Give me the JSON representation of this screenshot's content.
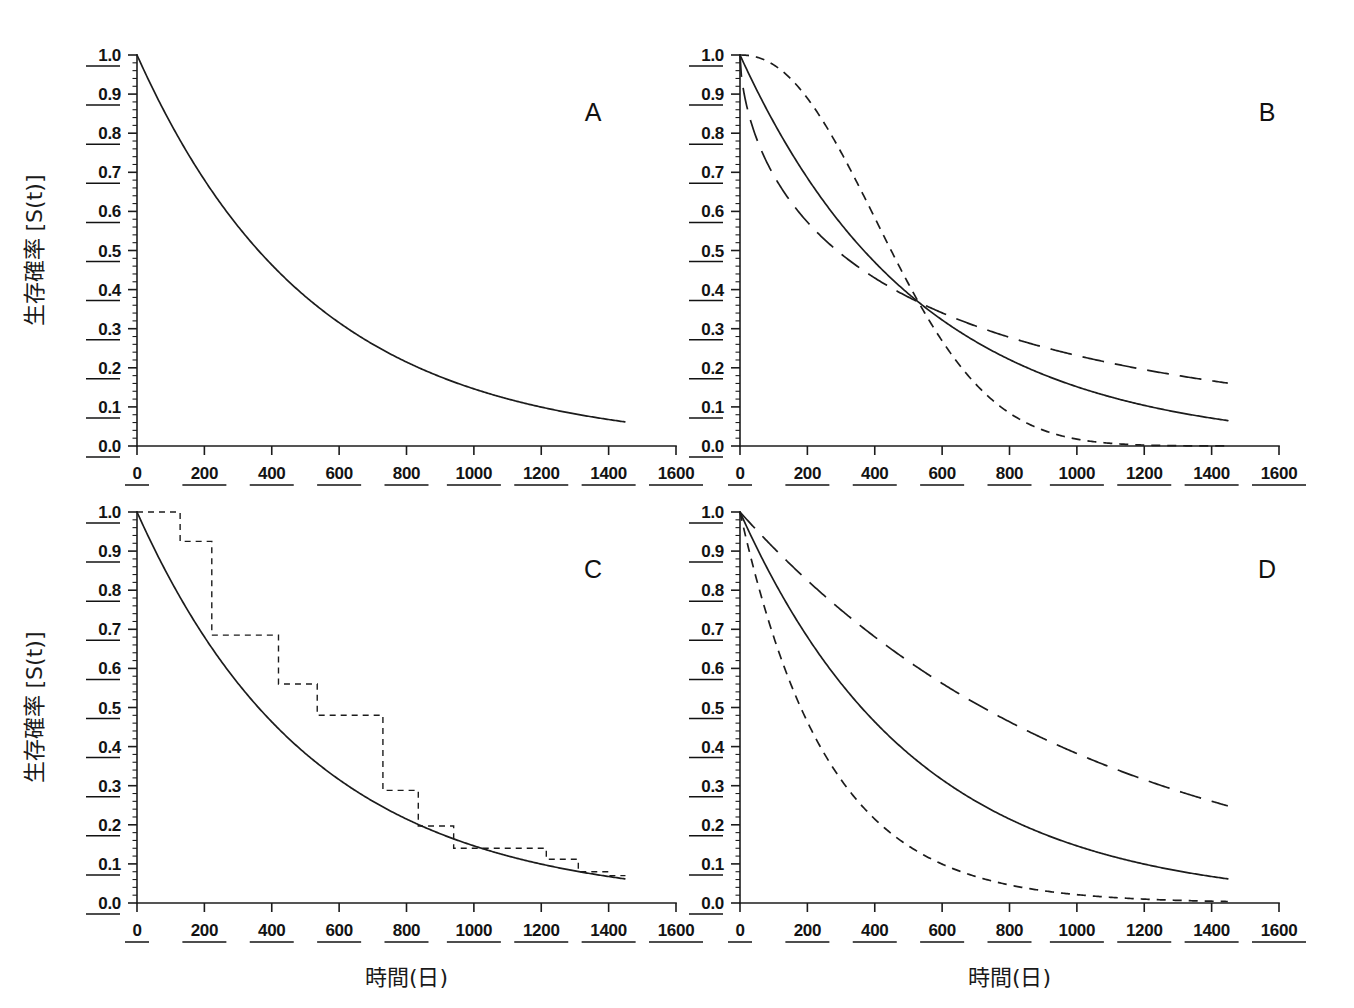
{
  "figure": {
    "background": "#ffffff",
    "ink_color": "#1c1c1c",
    "width": 1354,
    "height": 1008
  },
  "axis_titles": {
    "y": "生存確率 [S(t)]",
    "x": "時間(日)"
  },
  "tick_labels": {
    "y": [
      "0.0",
      "0.1",
      "0.2",
      "0.3",
      "0.4",
      "0.5",
      "0.6",
      "0.7",
      "0.8",
      "0.9",
      "1.0"
    ],
    "x": [
      "0",
      "200",
      "400",
      "600",
      "800",
      "1000",
      "1200",
      "1400",
      "1600"
    ]
  },
  "panel_letters": [
    "A",
    "B",
    "C",
    "D"
  ],
  "chart_data": [
    {
      "id": "A",
      "type": "line",
      "title": "A",
      "xlabel": "時間(日)",
      "ylabel": "生存確率 [S(t)]",
      "xlim": [
        0,
        1600
      ],
      "ylim": [
        0.0,
        1.0
      ],
      "xticks": [
        0,
        200,
        400,
        600,
        800,
        1000,
        1200,
        1400,
        1600
      ],
      "yticks": [
        0.0,
        0.1,
        0.2,
        0.3,
        0.4,
        0.5,
        0.6,
        0.7,
        0.8,
        0.9,
        1.0
      ],
      "grid": false,
      "legend": "none",
      "description": "Single exponential survival curve S(t)=exp(-t/520), drawn from t=0 to t=1450.",
      "series": [
        {
          "name": "exponential",
          "style": "solid",
          "model": "exp(-t/520)",
          "x": [
            0,
            50,
            100,
            150,
            200,
            250,
            300,
            350,
            400,
            450,
            500,
            550,
            600,
            650,
            700,
            750,
            800,
            850,
            900,
            950,
            1000,
            1050,
            1100,
            1150,
            1200,
            1250,
            1300,
            1350,
            1400,
            1450
          ],
          "y": [
            1.0,
            0.908,
            0.825,
            0.749,
            0.681,
            0.618,
            0.562,
            0.51,
            0.463,
            0.421,
            0.382,
            0.347,
            0.315,
            0.287,
            0.26,
            0.237,
            0.215,
            0.195,
            0.177,
            0.161,
            0.146,
            0.133,
            0.121,
            0.11,
            0.1,
            0.091,
            0.082,
            0.075,
            0.068,
            0.062
          ]
        }
      ]
    },
    {
      "id": "B",
      "type": "line",
      "title": "B",
      "xlabel": "時間(日)",
      "ylabel": "生存確率 [S(t)]",
      "xlim": [
        0,
        1600
      ],
      "ylim": [
        0.0,
        1.0
      ],
      "xticks": [
        0,
        200,
        400,
        600,
        800,
        1000,
        1200,
        1400,
        1600
      ],
      "yticks": [
        0.0,
        0.1,
        0.2,
        0.3,
        0.4,
        0.5,
        0.6,
        0.7,
        0.8,
        0.9,
        1.0
      ],
      "grid": false,
      "legend": "none",
      "description": "Three Weibull survival curves with common scale 530 days, crossing at S=0.368 at t=530. Shape parameters 0.6 (long dash), 1.0 (solid), 2.2 (short dash).",
      "crossing_point": {
        "x": 530,
        "y": 0.368
      },
      "series": [
        {
          "name": "weibull-shape-2.2",
          "style": "short-dash",
          "model": "exp(-(t/530)^2.2)",
          "x": [
            0,
            50,
            100,
            150,
            200,
            250,
            300,
            350,
            400,
            450,
            500,
            530,
            550,
            600,
            650,
            700,
            750,
            800,
            850,
            900,
            950,
            1000,
            1050,
            1100,
            1150,
            1200,
            1250,
            1300,
            1350,
            1400,
            1450
          ],
          "y": [
            1.0,
            0.994,
            0.975,
            0.946,
            0.906,
            0.857,
            0.8,
            0.736,
            0.668,
            0.597,
            0.524,
            0.48,
            0.452,
            0.382,
            0.316,
            0.255,
            0.2,
            0.153,
            0.113,
            0.081,
            0.056,
            0.038,
            0.024,
            0.015,
            0.009,
            0.005,
            0.003,
            0.0015,
            0.0008,
            0.0004,
            0.0002
          ]
        },
        {
          "name": "weibull-shape-1.0",
          "style": "solid",
          "model": "exp(-(t/530)^1.0)",
          "x": [
            0,
            50,
            100,
            150,
            200,
            250,
            300,
            350,
            400,
            450,
            500,
            530,
            550,
            600,
            650,
            700,
            750,
            800,
            850,
            900,
            950,
            1000,
            1050,
            1100,
            1150,
            1200,
            1250,
            1300,
            1350,
            1400,
            1450
          ],
          "y": [
            1.0,
            0.91,
            0.828,
            0.754,
            0.686,
            0.624,
            0.568,
            0.517,
            0.471,
            0.428,
            0.39,
            0.368,
            0.355,
            0.323,
            0.294,
            0.268,
            0.243,
            0.222,
            0.202,
            0.183,
            0.167,
            0.152,
            0.138,
            0.126,
            0.114,
            0.104,
            0.095,
            0.086,
            0.078,
            0.071,
            0.065
          ]
        },
        {
          "name": "weibull-shape-0.6",
          "style": "long-dash",
          "model": "exp(-(t/530)^0.6)",
          "x": [
            0,
            50,
            100,
            150,
            200,
            250,
            300,
            350,
            400,
            450,
            500,
            530,
            550,
            600,
            650,
            700,
            750,
            800,
            850,
            900,
            950,
            1000,
            1050,
            1100,
            1150,
            1200,
            1250,
            1300,
            1350,
            1400,
            1450
          ],
          "y": [
            1.0,
            0.762,
            0.68,
            0.623,
            0.578,
            0.541,
            0.509,
            0.481,
            0.456,
            0.434,
            0.414,
            0.402,
            0.395,
            0.378,
            0.362,
            0.348,
            0.334,
            0.321,
            0.309,
            0.298,
            0.287,
            0.277,
            0.268,
            0.259,
            0.251,
            0.243,
            0.235,
            0.228,
            0.221,
            0.215,
            0.208
          ]
        }
      ]
    },
    {
      "id": "C",
      "type": "line",
      "title": "C",
      "xlabel": "時間(日)",
      "ylabel": "生存確率 [S(t)]",
      "xlim": [
        0,
        1600
      ],
      "ylim": [
        0.0,
        1.0
      ],
      "xticks": [
        0,
        200,
        400,
        600,
        800,
        1000,
        1200,
        1400,
        1600
      ],
      "yticks": [
        0.0,
        0.1,
        0.2,
        0.3,
        0.4,
        0.5,
        0.6,
        0.7,
        0.8,
        0.9,
        1.0
      ],
      "grid": false,
      "legend": "none",
      "description": "Kaplan-Meier step estimate (dashed) overlaid on the fitted exponential survival curve exp(-t/520) (solid).",
      "series": [
        {
          "name": "fitted-exponential",
          "style": "solid",
          "model": "exp(-t/520)",
          "x": [
            0,
            50,
            100,
            150,
            200,
            250,
            300,
            350,
            400,
            450,
            500,
            550,
            600,
            650,
            700,
            750,
            800,
            850,
            900,
            950,
            1000,
            1050,
            1100,
            1150,
            1200,
            1250,
            1300,
            1350,
            1400,
            1450
          ],
          "y": [
            1.0,
            0.908,
            0.825,
            0.749,
            0.681,
            0.618,
            0.562,
            0.51,
            0.463,
            0.421,
            0.382,
            0.347,
            0.315,
            0.287,
            0.26,
            0.237,
            0.215,
            0.195,
            0.177,
            0.161,
            0.146,
            0.133,
            0.121,
            0.11,
            0.1,
            0.091,
            0.082,
            0.075,
            0.068,
            0.062
          ]
        },
        {
          "name": "kaplan-meier-step",
          "style": "km-dashed-step",
          "step_times": [
            0,
            70,
            128,
            222,
            237,
            420,
            535,
            548,
            730,
            820,
            835,
            925,
            940,
            1055,
            1215,
            1300,
            1310,
            1380,
            1450
          ],
          "step_values": [
            1.0,
            1.0,
            0.925,
            0.925,
            0.685,
            0.685,
            0.56,
            0.56,
            0.48,
            0.48,
            0.288,
            0.288,
            0.288,
            0.197,
            0.197,
            0.14,
            0.14,
            0.14,
            0.112,
            0.112,
            0.08,
            0.08,
            0.072,
            0.065
          ],
          "steps": [
            {
              "t_start": 0,
              "t_end": 128,
              "s": 1.0
            },
            {
              "t_start": 128,
              "t_end": 222,
              "s": 0.925
            },
            {
              "t_start": 222,
              "t_end": 420,
              "s": 0.685
            },
            {
              "t_start": 420,
              "t_end": 535,
              "s": 0.56
            },
            {
              "t_start": 535,
              "t_end": 730,
              "s": 0.48
            },
            {
              "t_start": 730,
              "t_end": 835,
              "s": 0.288
            },
            {
              "t_start": 835,
              "t_end": 940,
              "s": 0.197
            },
            {
              "t_start": 940,
              "t_end": 1215,
              "s": 0.14
            },
            {
              "t_start": 1215,
              "t_end": 1310,
              "s": 0.112
            },
            {
              "t_start": 1310,
              "t_end": 1400,
              "s": 0.08
            },
            {
              "t_start": 1400,
              "t_end": 1450,
              "s": 0.07
            }
          ]
        }
      ]
    },
    {
      "id": "D",
      "type": "line",
      "title": "D",
      "xlabel": "時間(日)",
      "ylabel": "生存確率 [S(t)]",
      "xlim": [
        0,
        1600
      ],
      "ylim": [
        0.0,
        1.0
      ],
      "xticks": [
        0,
        200,
        400,
        600,
        800,
        1000,
        1200,
        1400,
        1600
      ],
      "yticks": [
        0.0,
        0.1,
        0.2,
        0.3,
        0.4,
        0.5,
        0.6,
        0.7,
        0.8,
        0.9,
        1.0
      ],
      "grid": false,
      "legend": "none",
      "description": "Three proportional-hazards exponential survival curves with hazard ratios 0.5, 1.0 and 2.0 relative to baseline exp(-t/520).",
      "series": [
        {
          "name": "exponential-hr-0.5",
          "style": "long-dash",
          "model": "exp(-0.5*t/520)",
          "x": [
            0,
            100,
            200,
            300,
            400,
            500,
            600,
            700,
            800,
            900,
            1000,
            1100,
            1200,
            1300,
            1400,
            1450
          ],
          "y": [
            1.0,
            0.908,
            0.825,
            0.749,
            0.681,
            0.618,
            0.562,
            0.51,
            0.463,
            0.421,
            0.382,
            0.347,
            0.316,
            0.287,
            0.26,
            0.249
          ]
        },
        {
          "name": "exponential-hr-1.0",
          "style": "solid",
          "model": "exp(-t/520)",
          "x": [
            0,
            100,
            200,
            300,
            400,
            500,
            600,
            700,
            800,
            900,
            1000,
            1100,
            1200,
            1300,
            1400,
            1450
          ],
          "y": [
            1.0,
            0.825,
            0.681,
            0.562,
            0.463,
            0.382,
            0.315,
            0.26,
            0.215,
            0.177,
            0.146,
            0.121,
            0.1,
            0.082,
            0.068,
            0.062
          ]
        },
        {
          "name": "exponential-hr-2.0",
          "style": "short-dash",
          "model": "exp(-2*t/520)",
          "x": [
            0,
            100,
            200,
            300,
            400,
            500,
            600,
            700,
            800,
            900,
            1000,
            1100,
            1200,
            1300,
            1400,
            1450
          ],
          "y": [
            1.0,
            0.681,
            0.463,
            0.316,
            0.215,
            0.146,
            0.1,
            0.068,
            0.046,
            0.031,
            0.021,
            0.015,
            0.01,
            0.007,
            0.005,
            0.004
          ]
        }
      ]
    }
  ]
}
